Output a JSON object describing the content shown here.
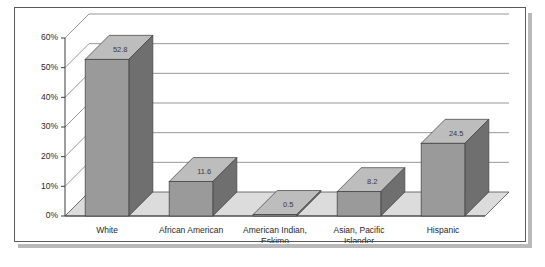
{
  "chart_data": {
    "type": "bar",
    "title": "",
    "subtitle": "",
    "xlabel": "",
    "ylabel": "",
    "categories": [
      "White",
      "African American",
      "American Indian, Eskimo",
      "Asian, Pacific Islander",
      "Hispanic"
    ],
    "category_lines": [
      [
        "White"
      ],
      [
        "African American"
      ],
      [
        "American Indian,",
        "Eskimo"
      ],
      [
        "Asian, Pacific",
        "Islander"
      ],
      [
        "Hispanic"
      ]
    ],
    "values": [
      52.8,
      11.6,
      0.5,
      8.2,
      24.5
    ],
    "value_labels": [
      "52.8",
      "11.6",
      "0.5",
      "8.2",
      "24.5"
    ],
    "ylim": [
      0,
      60
    ],
    "ytick_values": [
      0,
      10,
      20,
      30,
      40,
      50,
      60
    ],
    "ytick_labels": [
      "0%",
      "10%",
      "20%",
      "30%",
      "40%",
      "50%",
      "60%"
    ],
    "grid": true,
    "legend": false,
    "legend_position": "none",
    "three_d": true,
    "colors": {
      "bar_front": "#9a9a9a",
      "bar_side": "#6f6f6f",
      "bar_top": "#bdbdbd",
      "bar_outline": "#3d3d3d",
      "floor": "#dcdcdc",
      "wall": "#ffffff",
      "gridline": "#6b6b6b",
      "axis": "#3d3d3d",
      "frame_border": "#5a5a5a",
      "text": "#2a2a2a"
    }
  }
}
